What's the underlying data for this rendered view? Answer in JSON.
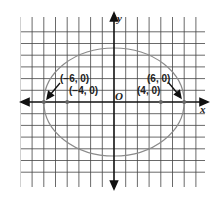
{
  "figure": {
    "type": "ellipse-graph",
    "equation_implied": "x^2/36 + y^2/20 = 1",
    "axes": {
      "x_label": "x",
      "y_label": "y",
      "origin_label": "O"
    },
    "grid": {
      "x_range": [
        -8,
        7
      ],
      "y_range": [
        -6,
        6
      ],
      "unit": 1
    },
    "ellipse": {
      "center": [
        0,
        0
      ],
      "semi_major": 6,
      "semi_minor": 4.47,
      "color": "#8a8a8a"
    },
    "points": [
      {
        "label": "(−6, 0)",
        "x": -6,
        "y": 0,
        "role": "vertex"
      },
      {
        "label": "(−4, 0)",
        "x": -4,
        "y": 0,
        "role": "focus"
      },
      {
        "label": "(4, 0)",
        "x": 4,
        "y": 0,
        "role": "focus"
      },
      {
        "label": "(6, 0)",
        "x": 6,
        "y": 0,
        "role": "vertex"
      }
    ]
  }
}
